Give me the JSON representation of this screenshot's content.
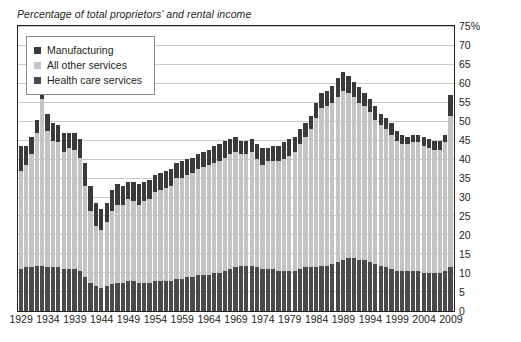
{
  "chart_data": {
    "type": "bar",
    "subtype": "stacked-bar",
    "title": "Percentage of total proprietors’ and rental income",
    "xlabel": "",
    "ylabel": "",
    "ylim": [
      0,
      75
    ],
    "ytick_step": 5,
    "ytick_labels": [
      "75%",
      "70",
      "65",
      "60",
      "55",
      "50",
      "45",
      "40",
      "35",
      "30",
      "25",
      "20",
      "15",
      "10",
      "5",
      "0"
    ],
    "ytick_values": [
      75,
      70,
      65,
      60,
      55,
      50,
      45,
      40,
      35,
      30,
      25,
      20,
      15,
      10,
      5,
      0
    ],
    "grid": true,
    "grid_axis": "y",
    "legend_position": "top-left",
    "x": [
      1929,
      1930,
      1931,
      1932,
      1933,
      1934,
      1935,
      1936,
      1937,
      1938,
      1939,
      1940,
      1941,
      1942,
      1943,
      1944,
      1945,
      1946,
      1947,
      1948,
      1949,
      1950,
      1951,
      1952,
      1953,
      1954,
      1955,
      1956,
      1957,
      1958,
      1959,
      1960,
      1961,
      1962,
      1963,
      1964,
      1965,
      1966,
      1967,
      1968,
      1969,
      1970,
      1971,
      1972,
      1973,
      1974,
      1975,
      1976,
      1977,
      1978,
      1979,
      1980,
      1981,
      1982,
      1983,
      1984,
      1985,
      1986,
      1987,
      1988,
      1989,
      1990,
      1991,
      1992,
      1993,
      1994,
      1995,
      1996,
      1997,
      1998,
      1999,
      2000,
      2001,
      2002,
      2003,
      2004,
      2005,
      2006,
      2007,
      2008,
      2009
    ],
    "xtick_labels": [
      "1929",
      "1934",
      "1939",
      "1944",
      "1949",
      "1954",
      "1959",
      "1964",
      "1969",
      "1974",
      "1979",
      "1984",
      "1989",
      "1994",
      "1999",
      "2004",
      "2009"
    ],
    "xtick_values": [
      1929,
      1934,
      1939,
      1944,
      1949,
      1954,
      1959,
      1964,
      1969,
      1974,
      1979,
      1984,
      1989,
      1994,
      1999,
      2004,
      2009
    ],
    "series": [
      {
        "name": "Health care services",
        "color": "#4a4a4c",
        "stack_order": 0,
        "values": [
          11.0,
          11.5,
          11.5,
          12.0,
          12.0,
          11.5,
          11.5,
          11.5,
          11.0,
          11.0,
          11.0,
          10.5,
          9.0,
          7.5,
          6.5,
          6.0,
          6.5,
          7.0,
          7.5,
          7.5,
          8.0,
          8.0,
          7.5,
          7.5,
          7.5,
          8.0,
          8.0,
          8.0,
          8.0,
          8.5,
          8.5,
          9.0,
          9.0,
          9.5,
          9.5,
          9.5,
          10.0,
          10.0,
          10.5,
          11.0,
          11.5,
          12.0,
          12.0,
          12.0,
          11.5,
          11.0,
          11.0,
          11.0,
          10.5,
          10.5,
          10.5,
          10.5,
          11.0,
          11.5,
          11.5,
          11.5,
          12.0,
          12.0,
          12.5,
          13.0,
          13.5,
          14.0,
          14.0,
          13.5,
          13.5,
          13.0,
          12.5,
          12.0,
          11.5,
          11.0,
          10.5,
          10.5,
          10.5,
          10.5,
          10.5,
          10.0,
          10.0,
          10.0,
          10.0,
          10.5,
          11.5
        ]
      },
      {
        "name": "All other services",
        "color": "#c4c4c4",
        "stack_order": 1,
        "values": [
          26.0,
          27.0,
          30.0,
          35.0,
          44.0,
          36.0,
          33.5,
          33.0,
          31.0,
          32.0,
          31.5,
          30.0,
          24.0,
          19.0,
          16.0,
          15.5,
          17.0,
          19.5,
          20.5,
          20.5,
          21.5,
          21.0,
          20.5,
          21.5,
          22.0,
          23.5,
          24.0,
          24.5,
          25.0,
          26.5,
          26.5,
          27.0,
          27.5,
          28.0,
          28.5,
          29.0,
          29.0,
          29.5,
          30.0,
          30.5,
          30.5,
          29.5,
          29.5,
          30.0,
          28.5,
          27.5,
          28.5,
          28.5,
          29.0,
          29.5,
          30.5,
          31.5,
          33.0,
          34.5,
          36.5,
          39.5,
          41.5,
          42.0,
          42.5,
          43.5,
          44.5,
          43.5,
          42.5,
          41.5,
          40.5,
          39.5,
          38.0,
          37.0,
          36.5,
          35.5,
          34.5,
          33.5,
          33.5,
          34.0,
          34.0,
          33.5,
          33.0,
          32.5,
          32.5,
          34.0,
          40.0
        ]
      },
      {
        "name": "Manufacturing",
        "color": "#3a3a3c",
        "stack_order": 2,
        "values": [
          6.5,
          5.0,
          4.5,
          3.5,
          3.0,
          4.5,
          4.5,
          4.5,
          5.0,
          4.0,
          4.5,
          5.0,
          6.0,
          6.5,
          6.0,
          5.5,
          5.0,
          5.5,
          5.5,
          5.0,
          4.5,
          5.0,
          5.5,
          5.0,
          5.0,
          4.5,
          4.5,
          4.5,
          4.5,
          4.0,
          4.5,
          4.0,
          4.0,
          4.0,
          4.0,
          4.0,
          4.5,
          4.5,
          4.5,
          4.0,
          4.0,
          3.5,
          3.5,
          3.5,
          4.0,
          4.5,
          3.5,
          4.0,
          4.0,
          4.5,
          4.5,
          4.0,
          4.0,
          3.5,
          3.5,
          4.0,
          4.0,
          4.0,
          4.5,
          5.0,
          5.0,
          4.5,
          4.0,
          4.0,
          3.5,
          3.5,
          3.5,
          3.0,
          3.0,
          3.0,
          2.5,
          2.5,
          2.0,
          2.0,
          2.0,
          2.5,
          2.5,
          2.5,
          2.5,
          2.0,
          5.5
        ]
      }
    ]
  },
  "legend": {
    "items": [
      {
        "label": "Manufacturing",
        "color": "#3a3a3c"
      },
      {
        "label": "All other services",
        "color": "#c4c4c4"
      },
      {
        "label": "Health care services",
        "color": "#4a4a4c"
      }
    ]
  },
  "colors": {
    "axis": "#231f20",
    "gridline": "#c9c9c9",
    "background": "#ffffff",
    "text": "#231f20"
  }
}
